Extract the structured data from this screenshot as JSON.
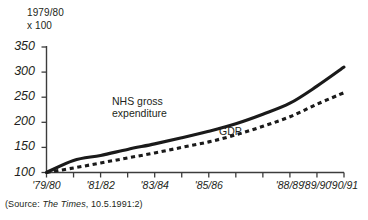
{
  "chart_data": {
    "type": "line",
    "title": "",
    "subtitle": "",
    "ylabel": "1979/80\nx 100",
    "xlabel": "",
    "ylim": [
      100,
      350
    ],
    "yticks": [
      100,
      150,
      200,
      250,
      300,
      350
    ],
    "ytick_labels": [
      "100",
      "150",
      "200",
      "250",
      "300",
      "350"
    ],
    "x": [
      "'79/80",
      "'80/81",
      "'81/82",
      "'82/83",
      "'83/84",
      "'84/85",
      "'85/86",
      "'86/87",
      "'87/88",
      "'88/89",
      "'89/90",
      "'90/91"
    ],
    "xtick_labels_shown": [
      "'79/80",
      "'81/82",
      "'83/84",
      "'85/86",
      "'88/89",
      "'89/90",
      "'90/91"
    ],
    "grid": false,
    "legend": "inline-annotations",
    "series": [
      {
        "name": "NHS gross expenditure",
        "style": "solid",
        "color": "#1a1a1a",
        "values": [
          100,
          124,
          134,
          146,
          157,
          169,
          182,
          197,
          216,
          238,
          272,
          310
        ]
      },
      {
        "name": "GDP",
        "style": "dashed",
        "color": "#1a1a1a",
        "values": [
          100,
          109,
          119,
          129,
          139,
          150,
          161,
          175,
          192,
          211,
          236,
          259
        ]
      }
    ],
    "annotations": [
      {
        "text": "NHS gross\nexpenditure",
        "series": "NHS gross expenditure"
      },
      {
        "text": "GDP",
        "series": "GDP"
      }
    ]
  },
  "source": {
    "prefix": "(Source: ",
    "publication": "The Times",
    "suffix": ", 10.5.1991:2)"
  }
}
